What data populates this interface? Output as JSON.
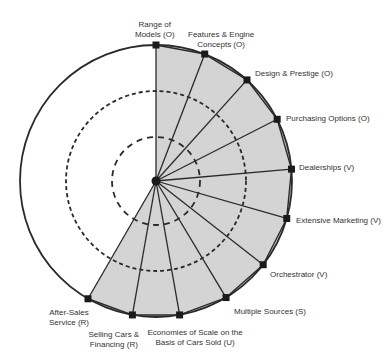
{
  "diagram": {
    "type": "radial-segment-diagram",
    "center": [
      156,
      181
    ],
    "outer_radius": 136,
    "dashed_radii": [
      90,
      44
    ],
    "colors": {
      "fill": "#d4d4d4",
      "stroke": "#2a2a2a",
      "background": "#ffffff"
    },
    "shaded_span_degrees": [
      0,
      210
    ],
    "spokes": [
      {
        "label": "Range of\nModels (O)",
        "line1": "Range of",
        "line2": "Models (O)",
        "angle": 0,
        "category": "O"
      },
      {
        "label": "Features & Engine Concepts (O)",
        "line1": "Features & Engine",
        "line2": "Concepts (O)",
        "angle": 21,
        "category": "O"
      },
      {
        "label": "Design & Prestige (O)",
        "line1": "Design & Prestige (O)",
        "line2": "",
        "angle": 42,
        "category": "O"
      },
      {
        "label": "Purchasing Options (O)",
        "line1": "Purchasing Options (O)",
        "line2": "",
        "angle": 63,
        "category": "O"
      },
      {
        "label": "Dealerships (V)",
        "line1": "Dealerships (V)",
        "line2": "",
        "angle": 85,
        "category": "V"
      },
      {
        "label": "Extensive Marketing (V)",
        "line1": "Extensive Marketing (V)",
        "line2": "",
        "angle": 106,
        "category": "V"
      },
      {
        "label": "Orchestrator (V)",
        "line1": "Orchestrator (V)",
        "line2": "",
        "angle": 128,
        "category": "V"
      },
      {
        "label": "Multiple Sources (S)",
        "line1": "Multiple Sources (S)",
        "line2": "",
        "angle": 149,
        "category": "S"
      },
      {
        "label": "Economies of Scale on the Basis of Cars Sold (U)",
        "line1": "Economies of Scale on the",
        "line2": "Basis of Cars Sold (U)",
        "angle": 170,
        "category": "U"
      },
      {
        "label": "Selling Cars & Financing (R)",
        "line1": "Selling Cars &",
        "line2": "Financing (R)",
        "angle": 190,
        "category": "R"
      },
      {
        "label": "After-Sales Service (R)",
        "line1": "After-Sales",
        "line2": "Service (R)",
        "angle": 210,
        "category": "R"
      }
    ]
  }
}
